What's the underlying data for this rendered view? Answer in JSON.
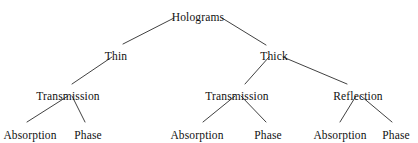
{
  "diagram": {
    "type": "hierarchy-tree",
    "background_color": "#ffffff",
    "line_color": "#2b2b2b",
    "text_color": "#111111",
    "nodes": [
      {
        "id": "holograms",
        "label": "Holograms",
        "level": 1,
        "x": 198,
        "y": 11
      },
      {
        "id": "thin",
        "label": "Thin",
        "level": 2,
        "x": 116,
        "y": 50
      },
      {
        "id": "thick",
        "label": "Thick",
        "level": 2,
        "x": 274,
        "y": 50
      },
      {
        "id": "thin-trans",
        "label": "Transmission",
        "level": 3,
        "x": 68,
        "y": 90
      },
      {
        "id": "thick-trans",
        "label": "Transmission",
        "level": 3,
        "x": 237,
        "y": 90
      },
      {
        "id": "thick-refl",
        "label": "Reflection",
        "level": 3,
        "x": 358,
        "y": 90
      },
      {
        "id": "thin-trans-abs",
        "label": "Absorption",
        "level": 4,
        "x": 30,
        "y": 129
      },
      {
        "id": "thin-trans-pha",
        "label": "Phase",
        "level": 4,
        "x": 88,
        "y": 129
      },
      {
        "id": "thick-trans-abs",
        "label": "Absorption",
        "level": 4,
        "x": 197,
        "y": 129
      },
      {
        "id": "thick-trans-pha",
        "label": "Phase",
        "level": 4,
        "x": 268,
        "y": 129
      },
      {
        "id": "thick-refl-abs",
        "label": "Absorption",
        "level": 4,
        "x": 340,
        "y": 129
      },
      {
        "id": "thick-refl-pha",
        "label": "Phase",
        "level": 4,
        "x": 396,
        "y": 129
      }
    ],
    "edges": [
      {
        "from": "holograms",
        "to": "thin",
        "x1": 174,
        "y1": 18,
        "x2": 123,
        "y2": 44
      },
      {
        "from": "holograms",
        "to": "thick",
        "x1": 222,
        "y1": 18,
        "x2": 266,
        "y2": 45
      },
      {
        "from": "thin",
        "to": "thin-trans",
        "x1": 112,
        "y1": 57,
        "x2": 72,
        "y2": 84
      },
      {
        "from": "thick",
        "to": "thick-trans",
        "x1": 269,
        "y1": 57,
        "x2": 245,
        "y2": 84
      },
      {
        "from": "thick",
        "to": "thick-refl",
        "x1": 283,
        "y1": 57,
        "x2": 347,
        "y2": 84
      },
      {
        "from": "thin-trans",
        "to": "thin-trans-abs",
        "x1": 68,
        "y1": 96,
        "x2": 27,
        "y2": 122
      },
      {
        "from": "thin-trans",
        "to": "thin-trans-pha",
        "x1": 72,
        "y1": 96,
        "x2": 85,
        "y2": 122
      },
      {
        "from": "thick-trans",
        "to": "thick-trans-abs",
        "x1": 235,
        "y1": 96,
        "x2": 203,
        "y2": 122
      },
      {
        "from": "thick-trans",
        "to": "thick-trans-pha",
        "x1": 241,
        "y1": 96,
        "x2": 266,
        "y2": 122
      },
      {
        "from": "thick-refl",
        "to": "thick-refl-abs",
        "x1": 356,
        "y1": 96,
        "x2": 340,
        "y2": 122
      },
      {
        "from": "thick-refl",
        "to": "thick-refl-pha",
        "x1": 361,
        "y1": 96,
        "x2": 392,
        "y2": 122
      }
    ]
  }
}
